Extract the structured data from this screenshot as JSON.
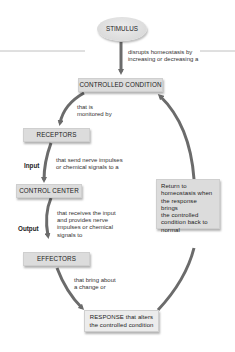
{
  "diagram": {
    "stimulus": "STIMULUS",
    "stimulus_caption": [
      "disrupts homeostasis by",
      "increasing or decreasing a"
    ],
    "controlled_condition": "CONTROLLED CONDITION",
    "monitored_caption": [
      "that is",
      "monitored by"
    ],
    "receptors": "RECEPTORS",
    "input_label": "Input",
    "receptors_caption": [
      "that send nerve impulses",
      "or chemical signals to a"
    ],
    "control_center": "CONTROL CENTER",
    "output_label": "Output",
    "control_center_caption": [
      "that receives the input",
      "and provides nerve",
      "impulses or chemical",
      "signals to"
    ],
    "effectors": "EFFECTORS",
    "effectors_caption": [
      "that bring about",
      "a change or"
    ],
    "response": [
      "RESPONSE that alters",
      "the controlled condition"
    ],
    "return_box": [
      "Return to",
      "homeostasis when",
      "the response brings",
      "the controlled",
      "condition back to",
      "normal"
    ]
  },
  "colors": {
    "box_fill": "#dcdcdc",
    "arrow": "#6b6b6b",
    "lines": "#9a9a9a"
  }
}
